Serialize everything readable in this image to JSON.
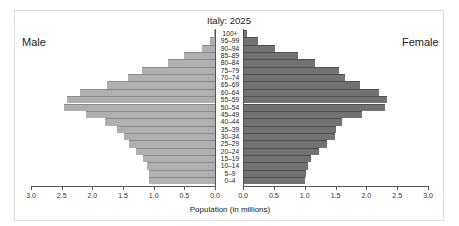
{
  "chart_data": {
    "type": "bar",
    "subtype": "population-pyramid",
    "title": "Italy: 2025",
    "xlabel": "Population (in millions)",
    "ylabel": "",
    "xlim": [
      0,
      3.0
    ],
    "x_ticks": [
      "3.0",
      "2.5",
      "2.0",
      "1.5",
      "1.0",
      "0.5",
      "0.0",
      "0.0",
      "0.5",
      "1.0",
      "1.5",
      "2.0",
      "2.5",
      "3.0"
    ],
    "side_labels": {
      "left": "Male",
      "right": "Female"
    },
    "categories": [
      "100+",
      "95–99",
      "90–94",
      "85–89",
      "80–84",
      "75–79",
      "70–74",
      "65–69",
      "60–64",
      "55–59",
      "50–54",
      "45–49",
      "40–44",
      "35–39",
      "30–34",
      "25–29",
      "20–24",
      "15–19",
      "10–14",
      "5–9",
      "0–4"
    ],
    "series": [
      {
        "name": "Male",
        "color": "#b0b0b0",
        "values": [
          0.01,
          0.08,
          0.21,
          0.51,
          0.77,
          1.19,
          1.42,
          1.75,
          2.2,
          2.4,
          2.45,
          2.09,
          1.79,
          1.6,
          1.48,
          1.4,
          1.29,
          1.17,
          1.11,
          1.08,
          1.07
        ]
      },
      {
        "name": "Female",
        "color": "#727272",
        "values": [
          0.06,
          0.24,
          0.52,
          0.89,
          1.17,
          1.56,
          1.65,
          1.9,
          2.2,
          2.33,
          2.3,
          1.93,
          1.6,
          1.51,
          1.49,
          1.35,
          1.23,
          1.1,
          1.05,
          1.02,
          1.0
        ]
      }
    ],
    "grid": false,
    "legend": "none"
  }
}
